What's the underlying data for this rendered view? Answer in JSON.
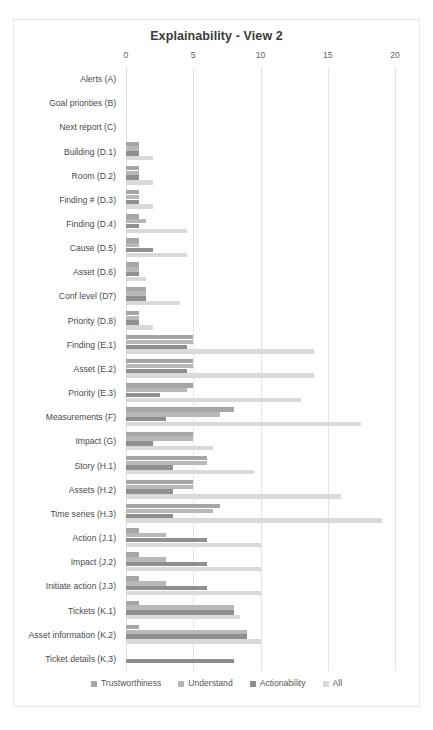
{
  "chart_data": {
    "type": "bar",
    "orientation": "horizontal",
    "title": "Explainability - View 2",
    "xlabel": "",
    "ylabel": "",
    "xlim": [
      0,
      20
    ],
    "xticks": [
      0,
      5,
      10,
      15,
      20
    ],
    "grid": true,
    "legend_position": "bottom",
    "categories": [
      "Alerts (A)",
      "Goal priorities (B)",
      "Next report (C)",
      "Building (D.1)",
      "Room (D.2)",
      "Finding # (D.3)",
      "Finding (D.4)",
      "Cause (D.5)",
      "Asset (D.6)",
      "Conf level (D7)",
      "Priority (D.8)",
      "Finding (E.1)",
      "Asset (E.2)",
      "Priority (E.3)",
      "Measurements (F)",
      "Impact (G)",
      "Story (H.1)",
      "Assets (H.2)",
      "Time series (H.3)",
      "Action (J.1)",
      "Impact (J.2)",
      "Initiate action (J.3)",
      "Tickets (K.1)",
      "Asset information (K.2)",
      "Ticket details (K.3)"
    ],
    "series": [
      {
        "name": "Trustworthiness",
        "color": "#a6a6a6",
        "values": [
          0,
          0,
          0,
          1,
          1,
          1,
          1,
          1,
          1,
          1.5,
          1,
          5,
          5,
          5,
          8,
          5,
          6,
          5,
          7,
          1,
          1,
          1,
          1,
          1,
          0
        ]
      },
      {
        "name": "Understand",
        "color": "#b8b8b8",
        "values": [
          0,
          0,
          0,
          1,
          1,
          1,
          1.5,
          1,
          1,
          1.5,
          1,
          5,
          5,
          4.5,
          7,
          5,
          6,
          5,
          6.5,
          3,
          3,
          3,
          8,
          9,
          0
        ]
      },
      {
        "name": "Actionability",
        "color": "#8f8f8f",
        "values": [
          0,
          0,
          0,
          1,
          1,
          1,
          1,
          2,
          1,
          1.5,
          1,
          4.5,
          4.5,
          2.5,
          3,
          2,
          3.5,
          3.5,
          3.5,
          6,
          6,
          6,
          8,
          9,
          8
        ]
      },
      {
        "name": "All",
        "color": "#d9d9d9",
        "values": [
          0,
          0,
          0,
          2,
          2,
          2,
          4.5,
          4.5,
          1.5,
          4,
          2,
          14,
          14,
          13,
          17.5,
          6.5,
          9.5,
          16,
          19,
          10,
          10,
          10,
          8.5,
          10,
          0
        ]
      }
    ]
  },
  "legend": {
    "items": [
      {
        "label": "Trustworthiness",
        "color": "#a6a6a6"
      },
      {
        "label": "Understand",
        "color": "#b8b8b8"
      },
      {
        "label": "Actionability",
        "color": "#8f8f8f"
      },
      {
        "label": "All",
        "color": "#d9d9d9"
      }
    ]
  }
}
